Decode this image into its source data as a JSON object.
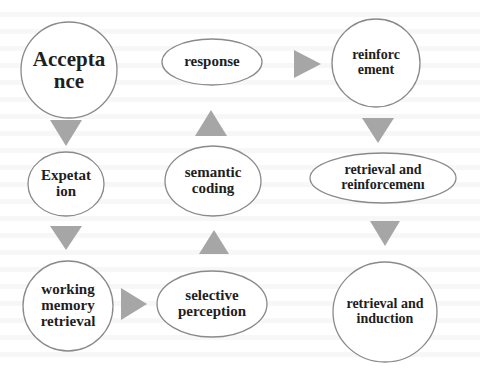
{
  "diagram": {
    "type": "flow",
    "nodes": [
      {
        "id": "acceptance",
        "label": "Accepta\nnce",
        "shape": "circle",
        "cx": 69,
        "cy": 70,
        "rx": 48,
        "ry": 48,
        "font_size": 21
      },
      {
        "id": "response",
        "label": "response",
        "shape": "ellipse",
        "cx": 212,
        "cy": 62,
        "rx": 50,
        "ry": 23,
        "font_size": 15
      },
      {
        "id": "reinforcement",
        "label": "reinforc\nement",
        "shape": "circle",
        "cx": 376,
        "cy": 63,
        "rx": 44,
        "ry": 44,
        "font_size": 14
      },
      {
        "id": "expetation",
        "label": "Expetat\nion",
        "shape": "ellipse",
        "cx": 66,
        "cy": 184,
        "rx": 38,
        "ry": 32,
        "font_size": 15
      },
      {
        "id": "semantic-coding",
        "label": "semantic\ncoding",
        "shape": "ellipse",
        "cx": 213,
        "cy": 181,
        "rx": 48,
        "ry": 35,
        "font_size": 15
      },
      {
        "id": "retrieval-reinforcement",
        "label": "retrieval and\nreinforcemenı",
        "shape": "ellipse",
        "cx": 383,
        "cy": 178,
        "rx": 73,
        "ry": 25,
        "font_size": 14
      },
      {
        "id": "working-memory-retrieval",
        "label": "working\nmemory\nretrieval",
        "shape": "circle",
        "cx": 68,
        "cy": 306,
        "rx": 45,
        "ry": 45,
        "font_size": 15
      },
      {
        "id": "selective-perception",
        "label": "selective\nperception",
        "shape": "ellipse",
        "cx": 212,
        "cy": 304,
        "rx": 55,
        "ry": 33,
        "font_size": 15
      },
      {
        "id": "retrieval-induction",
        "label": "retrieval and\ninduction",
        "shape": "ellipse",
        "cx": 385,
        "cy": 312,
        "rx": 52,
        "ry": 50,
        "font_size": 14
      }
    ],
    "arrows": [
      {
        "id": "acceptance-to-expetation",
        "direction": "down",
        "points": "50,120 82,120 66,146"
      },
      {
        "id": "expetation-to-working-memory",
        "direction": "down",
        "points": "50,226 82,226 66,250"
      },
      {
        "id": "working-memory-to-selective",
        "direction": "right",
        "points": "121,288 121,320 147,304"
      },
      {
        "id": "selective-to-semantic",
        "direction": "up",
        "points": "199,254 229,254 214,230"
      },
      {
        "id": "semantic-to-response",
        "direction": "up",
        "points": "195,136 227,136 211,110"
      },
      {
        "id": "response-to-reinforcement",
        "direction": "right",
        "points": "294,50 294,78 321,64"
      },
      {
        "id": "reinforcement-to-retrieval-reinforcement",
        "direction": "down",
        "points": "362,118 394,118 378,143"
      },
      {
        "id": "retrieval-reinforcement-to-retrieval-induction",
        "direction": "down",
        "points": "370,221 400,221 385,246"
      }
    ],
    "colors": {
      "arrow_fill": "#a6a6a6",
      "node_stroke": "#8a8a8a",
      "node_fill": "#ffffff",
      "text": "#1e1e1e"
    }
  }
}
